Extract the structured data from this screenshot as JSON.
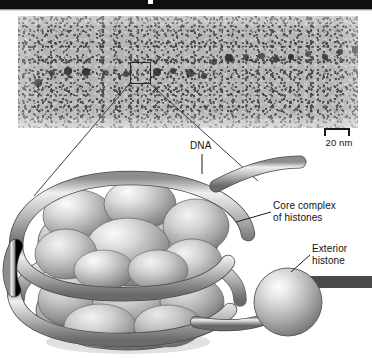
{
  "figure": {
    "background_color": "#ffffff"
  },
  "topbar": {
    "color": "#100f0d"
  },
  "micrograph": {
    "name": "chromatin-beads-on-a-string-electron-micrograph",
    "base_color": "#b5b5b3",
    "bead_color": "#2e2e2c",
    "description": "Grainy grayscale electron micrograph showing beads-on-a-string chromatin fibers",
    "beads": [
      {
        "x": 20,
        "y": 83,
        "r": 4.2
      },
      {
        "x": 34,
        "y": 73,
        "r": 3.4
      },
      {
        "x": 50,
        "y": 71,
        "r": 4.0
      },
      {
        "x": 68,
        "y": 72,
        "r": 3.8
      },
      {
        "x": 88,
        "y": 73,
        "r": 3.4
      },
      {
        "x": 108,
        "y": 74,
        "r": 3.2
      },
      {
        "x": 139,
        "y": 72,
        "r": 3.6
      },
      {
        "x": 155,
        "y": 71,
        "r": 3.0
      },
      {
        "x": 172,
        "y": 73,
        "r": 3.8
      },
      {
        "x": 186,
        "y": 76,
        "r": 3.2
      },
      {
        "x": 196,
        "y": 62,
        "r": 3.0
      },
      {
        "x": 211,
        "y": 58,
        "r": 3.6
      },
      {
        "x": 228,
        "y": 57,
        "r": 3.2
      },
      {
        "x": 244,
        "y": 56,
        "r": 2.9
      },
      {
        "x": 258,
        "y": 59,
        "r": 3.2
      },
      {
        "x": 273,
        "y": 57,
        "r": 2.8
      },
      {
        "x": 290,
        "y": 54,
        "r": 3.4
      },
      {
        "x": 307,
        "y": 57,
        "r": 3.0
      },
      {
        "x": 322,
        "y": 52,
        "r": 3.2
      },
      {
        "x": 338,
        "y": 50,
        "r": 3.6
      },
      {
        "x": 348,
        "y": 108,
        "r": 4.0
      }
    ]
  },
  "inset": {
    "name": "magnified-region-selection-box",
    "x": 130,
    "y": 62,
    "width": 19,
    "height": 20
  },
  "scale": {
    "label": "20 nm",
    "bar_length_px": 22
  },
  "labels": {
    "dna": "DNA",
    "core_complex_line1": "Core complex",
    "core_complex_line2": "of histones",
    "exterior_line1": "Exterior",
    "exterior_line2": "histone"
  },
  "diagram": {
    "name": "nucleosome-diagram",
    "histone_light": "#f2f2f0",
    "histone_mid": "#b9b9b7",
    "histone_dark": "#757573",
    "dna_light": "#e8e8e6",
    "dna_mid": "#a9a9a7",
    "dna_dark": "#6e6e6c",
    "outline": "#3a3a38"
  }
}
